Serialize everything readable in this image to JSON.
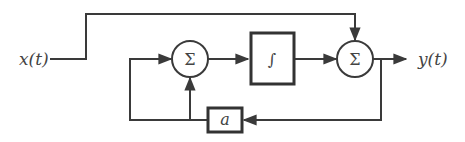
{
  "diagram": {
    "type": "block-diagram",
    "input": {
      "label": "x(t)"
    },
    "output": {
      "label": "y(t)"
    },
    "blocks": [
      {
        "id": "sum1",
        "kind": "summing-junction",
        "symbol": "Σ"
      },
      {
        "id": "integrator",
        "kind": "integrator",
        "symbol": "∫"
      },
      {
        "id": "sum2",
        "kind": "summing-junction",
        "symbol": "Σ"
      },
      {
        "id": "gain",
        "kind": "gain",
        "symbol": "a"
      }
    ],
    "connections": [
      {
        "from": "x(t)",
        "to": "sum2",
        "note": "feedforward path over top"
      },
      {
        "from": "sum1",
        "to": "integrator"
      },
      {
        "from": "integrator",
        "to": "sum2"
      },
      {
        "from": "sum2",
        "to": "y(t)"
      },
      {
        "from": "y(t)",
        "to": "gain",
        "note": "feedback from output"
      },
      {
        "from": "gain",
        "to": "sum1",
        "note": "enters left side and bottom of sum1"
      }
    ],
    "colors": {
      "line": "#3a3a3a",
      "text": "#444444",
      "background": "#ffffff"
    }
  }
}
